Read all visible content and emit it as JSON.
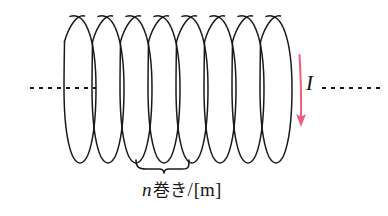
{
  "figure": {
    "background_color": "#ffffff",
    "width": 388,
    "height": 216
  },
  "coil": {
    "name": "solenoid-coil",
    "turns_drawn": 8,
    "stroke_color": "#1a1a1a",
    "stroke_width": 1.5,
    "loop_ellipse_rx": 16,
    "loop_ellipse_ry": 75,
    "first_loop_cx": 80,
    "loop_pitch": 28,
    "axis_cy": 88
  },
  "axis": {
    "name": "central-axis",
    "stroke_color": "#1a1a1a",
    "dash_pattern": "4 5",
    "stroke_width": 2,
    "left_segment": {
      "x1": 30,
      "x2": 96,
      "y": 88
    },
    "right_segment": {
      "x1": 322,
      "x2": 382,
      "y": 88
    }
  },
  "current_arrow": {
    "name": "current-arrow",
    "color": "#e8607d",
    "x": 300,
    "y_start": 55,
    "y_end": 122,
    "stroke_width": 2
  },
  "brace": {
    "name": "turns-brace",
    "color": "#1a1a1a",
    "stroke_width": 1.6,
    "x_left": 136,
    "x_right": 192,
    "y_top": 160,
    "y_bottom": 172
  },
  "labels": {
    "current": "I",
    "turns": {
      "variable": "n",
      "cjk": "巻き",
      "slash": "/",
      "unit": "[m]",
      "full_text": "n巻き/[m]"
    }
  },
  "colors": {
    "ink": "#1a1a1a",
    "accent_pink": "#e8607d",
    "paper": "#ffffff"
  }
}
